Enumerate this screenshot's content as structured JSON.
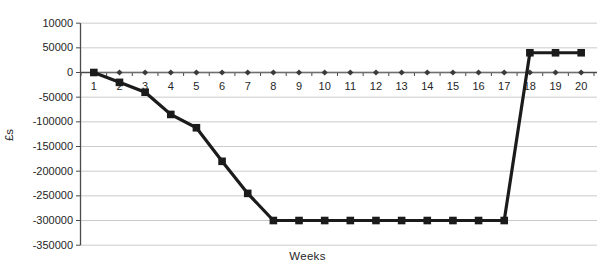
{
  "chart_data": {
    "type": "line",
    "title": "",
    "xlabel": "Weeks",
    "ylabel": "£s",
    "categories": [
      "1",
      "2",
      "3",
      "4",
      "5",
      "6",
      "7",
      "8",
      "9",
      "10",
      "11",
      "12",
      "13",
      "14",
      "15",
      "16",
      "17",
      "18",
      "19",
      "20"
    ],
    "y_axis": {
      "min": -350000,
      "max": 100000,
      "step": 50000,
      "grid": true,
      "ticks": [
        {
          "value": 100000,
          "label": "10000"
        },
        {
          "value": 50000,
          "label": "50000"
        },
        {
          "value": 0,
          "label": "0"
        },
        {
          "value": -50000,
          "label": "-50000"
        },
        {
          "value": -100000,
          "label": "-100000"
        },
        {
          "value": -150000,
          "label": "-150000"
        },
        {
          "value": -200000,
          "label": "-200000"
        },
        {
          "value": -250000,
          "label": "-250000"
        },
        {
          "value": -300000,
          "label": "-300000"
        },
        {
          "value": -350000,
          "label": "-350000"
        }
      ]
    },
    "legend": "none",
    "series": [
      {
        "name": "zero-baseline",
        "marker": "diamond",
        "marker_color": "#3a3a3a",
        "line_color": "#6f6f6f",
        "line_width": 1.2,
        "values": [
          0,
          0,
          0,
          0,
          0,
          0,
          0,
          0,
          0,
          0,
          0,
          0,
          0,
          0,
          0,
          0,
          0,
          0,
          0,
          0
        ]
      },
      {
        "name": "cumulative-cash-flow",
        "marker": "square",
        "marker_color": "#1b1b1b",
        "line_color": "#1b1b1b",
        "line_width": 3.2,
        "values": [
          0,
          -20000,
          -40000,
          -85000,
          -112000,
          -180000,
          -245000,
          -300000,
          -300000,
          -300000,
          -300000,
          -300000,
          -300000,
          -300000,
          -300000,
          -300000,
          -300000,
          40000,
          40000,
          40000
        ]
      }
    ]
  },
  "colors": {
    "background": "#ffffff",
    "gridline": "#cbcbcb",
    "axis": "#4a4a4a",
    "tick_text": "#262626"
  },
  "layout_values": {
    "plot_left": 81,
    "plot_right": 594,
    "zero_y": 72.5,
    "px_per_50000": 24.67
  }
}
